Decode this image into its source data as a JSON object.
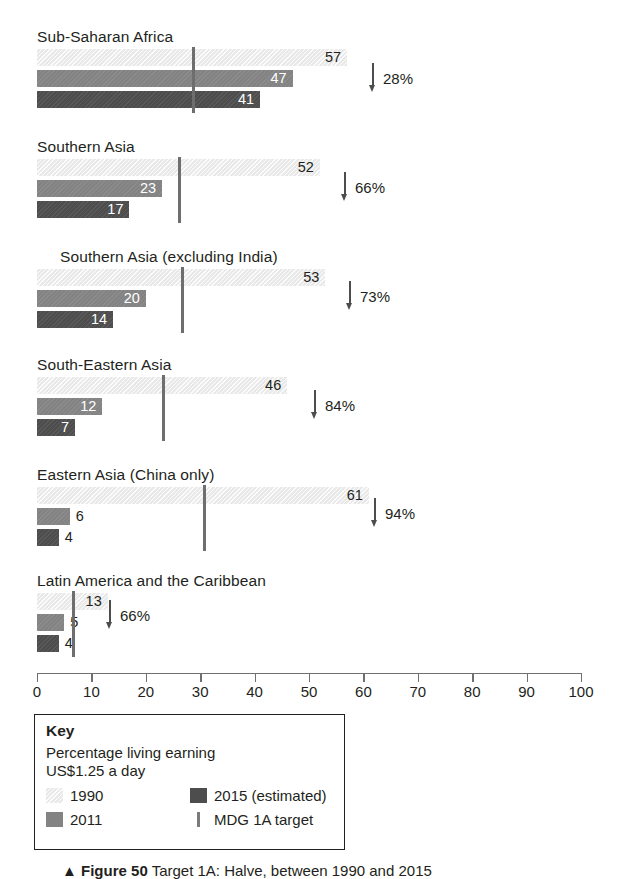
{
  "chart_data": {
    "type": "bar",
    "orientation": "horizontal",
    "title": "",
    "xlabel": "",
    "ylabel": "",
    "xlim": [
      0,
      100
    ],
    "xticks": [
      0,
      10,
      20,
      30,
      40,
      50,
      60,
      70,
      80,
      90,
      100
    ],
    "grid": false,
    "legend_position": "bottom-left-box",
    "categories": [
      "Sub-Saharan Africa",
      "Southern Asia",
      "Southern Asia (excluding India)",
      "South-Eastern Asia",
      "Eastern Asia (China only)",
      "Latin America and the Caribbean"
    ],
    "series": [
      {
        "name": "1990",
        "color": "#e9e9e9",
        "values": [
          57,
          52,
          53,
          46,
          61,
          13
        ]
      },
      {
        "name": "2011",
        "color": "#838383",
        "values": [
          47,
          23,
          20,
          12,
          6,
          5
        ]
      },
      {
        "name": "2015 (estimated)",
        "color": "#4d4d4d",
        "values": [
          41,
          17,
          14,
          7,
          4,
          4
        ]
      },
      {
        "name": "MDG 1A target",
        "color": "#6e6e6e",
        "type": "marker-line",
        "values": [
          28.5,
          26,
          26.5,
          23,
          30.5,
          6.5
        ]
      }
    ],
    "annotations": [
      {
        "category": "Sub-Saharan Africa",
        "text": "28%",
        "marker": "down-arrow"
      },
      {
        "category": "Southern Asia",
        "text": "66%",
        "marker": "down-arrow"
      },
      {
        "category": "Southern Asia (excluding India)",
        "text": "73%",
        "marker": "down-arrow"
      },
      {
        "category": "South-Eastern Asia",
        "text": "84%",
        "marker": "down-arrow"
      },
      {
        "category": "Eastern Asia (China only)",
        "text": "94%",
        "marker": "down-arrow"
      },
      {
        "category": "Latin America and the Caribbean",
        "text": "66%",
        "marker": "down-arrow"
      }
    ]
  },
  "groups": [
    {
      "label": "Sub-Saharan Africa",
      "indent": false,
      "v1990": "57",
      "v2011": "47",
      "v2015": "41",
      "delta": "28%"
    },
    {
      "label": "Southern Asia",
      "indent": false,
      "v1990": "52",
      "v2011": "23",
      "v2015": "17",
      "delta": "66%"
    },
    {
      "label": "Southern Asia (excluding India)",
      "indent": true,
      "v1990": "53",
      "v2011": "20",
      "v2015": "14",
      "delta": "73%"
    },
    {
      "label": "South-Eastern Asia",
      "indent": false,
      "v1990": "46",
      "v2011": "12",
      "v2015": "7",
      "delta": "84%"
    },
    {
      "label": "Eastern Asia (China only)",
      "indent": false,
      "v1990": "61",
      "v2011": "6",
      "v2015": "4",
      "delta": "94%"
    },
    {
      "label": "Latin America and the Caribbean",
      "indent": false,
      "v1990": "13",
      "v2011": "5",
      "v2015": "4",
      "delta": "66%"
    }
  ],
  "axis": {
    "labels": [
      "0",
      "10",
      "20",
      "30",
      "40",
      "50",
      "60",
      "70",
      "80",
      "90",
      "100"
    ]
  },
  "key": {
    "title": "Key",
    "subtitle_line1": "Percentage living earning",
    "subtitle_line2": "US$1.25 a day",
    "items": [
      {
        "label": "1990",
        "swatch": "y1990"
      },
      {
        "label": "2011",
        "swatch": "y2011"
      },
      {
        "label": "2015 (estimated)",
        "swatch": "y2015"
      },
      {
        "label": "MDG 1A target",
        "swatch": "line"
      }
    ]
  },
  "caption": {
    "marker": "▲",
    "figure": "Figure 50",
    "text": "Target 1A: Halve, between 1990 and 2015"
  }
}
